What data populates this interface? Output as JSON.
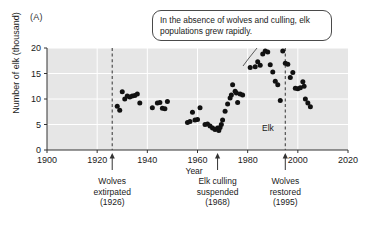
{
  "figure": {
    "panel_label": "(A)"
  },
  "chart_data": {
    "type": "scatter",
    "title": "",
    "xlabel": "Year",
    "ylabel": "Number of elk (thousand)",
    "xlim": [
      1900,
      2020
    ],
    "ylim": [
      0,
      20
    ],
    "xticks": [
      1900,
      1920,
      1940,
      1960,
      1980,
      2000,
      2020
    ],
    "xtick_labels": [
      "1900",
      "1920",
      "1940",
      "1960",
      "1980",
      "2000",
      "2020"
    ],
    "yticks": [
      0,
      5,
      10,
      15,
      20
    ],
    "ytick_labels": [
      "0",
      "5",
      "10",
      "15",
      "20"
    ],
    "grid": "horizontal-white-gridlines",
    "plot_background": "#e6e6e6",
    "marker_color": "#111111",
    "legend": "none",
    "series": [
      {
        "name": "Elk",
        "points": [
          [
            1928,
            8.6
          ],
          [
            1929,
            7.8
          ],
          [
            1930,
            11.4
          ],
          [
            1931,
            10.0
          ],
          [
            1932,
            10.6
          ],
          [
            1933,
            10.4
          ],
          [
            1934,
            10.6
          ],
          [
            1935,
            10.7
          ],
          [
            1936,
            11.0
          ],
          [
            1937,
            9.2
          ],
          [
            1942,
            8.3
          ],
          [
            1944,
            9.2
          ],
          [
            1945,
            9.3
          ],
          [
            1946,
            8.2
          ],
          [
            1947,
            8.1
          ],
          [
            1948,
            9.5
          ],
          [
            1956,
            5.4
          ],
          [
            1957,
            5.6
          ],
          [
            1958,
            7.4
          ],
          [
            1959,
            5.9
          ],
          [
            1960,
            6.0
          ],
          [
            1961,
            8.3
          ],
          [
            1963,
            5.0
          ],
          [
            1964,
            5.1
          ],
          [
            1965,
            4.7
          ],
          [
            1966,
            4.3
          ],
          [
            1967,
            4.0
          ],
          [
            1968,
            4.3
          ],
          [
            1968.5,
            3.8
          ],
          [
            1969,
            4.4
          ],
          [
            1969.5,
            5.0
          ],
          [
            1970,
            5.9
          ],
          [
            1971,
            7.6
          ],
          [
            1972,
            9.0
          ],
          [
            1973,
            10.2
          ],
          [
            1973.5,
            10.8
          ],
          [
            1974,
            12.8
          ],
          [
            1975,
            11.5
          ],
          [
            1975.5,
            11.2
          ],
          [
            1976,
            9.3
          ],
          [
            1977,
            11.0
          ],
          [
            1978,
            10.8
          ],
          [
            1981,
            16.2
          ],
          [
            1983,
            16.3
          ],
          [
            1984,
            17.3
          ],
          [
            1985,
            16.6
          ],
          [
            1986,
            18.8
          ],
          [
            1987,
            19.4
          ],
          [
            1988,
            19.2
          ],
          [
            1989,
            16.7
          ],
          [
            1990,
            15.3
          ],
          [
            1991,
            13.5
          ],
          [
            1992,
            12.8
          ],
          [
            1993,
            9.7
          ],
          [
            1994,
            19.4
          ],
          [
            1995,
            17.0
          ],
          [
            1996,
            16.8
          ],
          [
            1997,
            14.2
          ],
          [
            1998,
            15.2
          ],
          [
            1999,
            12.1
          ],
          [
            2000,
            12.0
          ],
          [
            2001,
            12.2
          ],
          [
            2002,
            13.4
          ],
          [
            2002.5,
            12.5
          ],
          [
            2003,
            10.0
          ],
          [
            2004,
            9.2
          ],
          [
            2005,
            8.5
          ]
        ]
      }
    ],
    "inplot_label": "Elk",
    "event_lines": [
      {
        "year": 1926,
        "label_lines": [
          "Wolves",
          "extirpated",
          "(1926)"
        ],
        "style": "dashed-vertical"
      },
      {
        "year": 1968,
        "label_lines": [
          "Elk culling",
          "suspended",
          "(1968)"
        ],
        "style": "arrow-only"
      },
      {
        "year": 1995,
        "label_lines": [
          "Wolves",
          "restored",
          "(1995)"
        ],
        "style": "dashed-vertical"
      }
    ],
    "callout": {
      "text": "In the absence of wolves and culling, elk populations grew rapidly.",
      "points_to_year": 1981
    }
  }
}
